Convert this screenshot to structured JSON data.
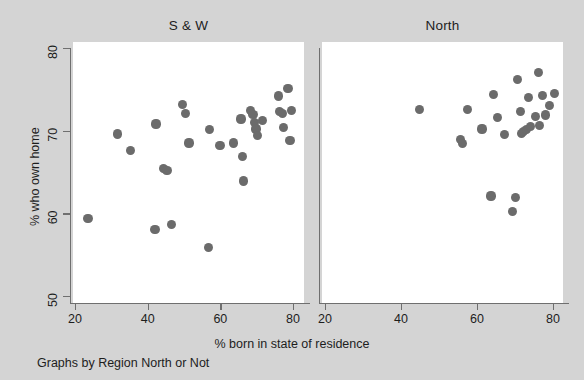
{
  "figure": {
    "background_color": "#d4d4d4",
    "plot_background_color": "#ffffff",
    "marker_color": "#6b6b6b",
    "axis_color": "#6f6f6f",
    "text_color": "#1d1d1d",
    "caption": "Graphs by Region North or Not",
    "xlabel": "% born in state of residence",
    "ylabel": "% who own home"
  },
  "chart_data": {
    "type": "scatter",
    "title": "",
    "subtitle": "",
    "xlabel": "% born in state of residence",
    "ylabel": "% who own home",
    "caption": "Graphs by Region North or Not",
    "grid": false,
    "legend": "none",
    "xlim": [
      16,
      84
    ],
    "ylim": [
      48,
      81
    ],
    "xticks": [
      20,
      40,
      60,
      80
    ],
    "yticks": [
      50,
      60,
      70,
      80
    ],
    "xtick_labels": [
      "20",
      "40",
      "60",
      "80"
    ],
    "ytick_labels": [
      "50",
      "60",
      "70",
      "80"
    ],
    "panels": [
      {
        "label": "S & W",
        "points": [
          {
            "x": 23.6,
            "y": 59.4
          },
          {
            "x": 31.8,
            "y": 69.6
          },
          {
            "x": 35.2,
            "y": 67.6
          },
          {
            "x": 42.0,
            "y": 58.0
          },
          {
            "x": 42.3,
            "y": 70.8
          },
          {
            "x": 44.4,
            "y": 65.4
          },
          {
            "x": 45.3,
            "y": 65.2
          },
          {
            "x": 46.5,
            "y": 58.6
          },
          {
            "x": 49.7,
            "y": 73.2
          },
          {
            "x": 50.4,
            "y": 72.1
          },
          {
            "x": 51.4,
            "y": 68.5
          },
          {
            "x": 56.7,
            "y": 55.9
          },
          {
            "x": 57.0,
            "y": 70.1
          },
          {
            "x": 59.9,
            "y": 68.2
          },
          {
            "x": 63.6,
            "y": 68.5
          },
          {
            "x": 65.7,
            "y": 71.4
          },
          {
            "x": 66.1,
            "y": 66.9
          },
          {
            "x": 66.3,
            "y": 63.9
          },
          {
            "x": 68.3,
            "y": 72.4
          },
          {
            "x": 69.0,
            "y": 72.0
          },
          {
            "x": 69.4,
            "y": 71.0
          },
          {
            "x": 69.8,
            "y": 70.2
          },
          {
            "x": 70.3,
            "y": 69.4
          },
          {
            "x": 71.5,
            "y": 71.2
          },
          {
            "x": 76.0,
            "y": 74.2
          },
          {
            "x": 76.3,
            "y": 72.3
          },
          {
            "x": 77.1,
            "y": 72.1
          },
          {
            "x": 77.4,
            "y": 70.4
          },
          {
            "x": 78.6,
            "y": 75.1
          },
          {
            "x": 79.2,
            "y": 68.8
          },
          {
            "x": 79.6,
            "y": 72.4
          }
        ]
      },
      {
        "label": "North",
        "points": [
          {
            "x": 44.8,
            "y": 72.6
          },
          {
            "x": 55.6,
            "y": 68.9
          },
          {
            "x": 56.2,
            "y": 68.4
          },
          {
            "x": 57.5,
            "y": 72.6
          },
          {
            "x": 61.3,
            "y": 70.2
          },
          {
            "x": 63.7,
            "y": 62.1
          },
          {
            "x": 64.3,
            "y": 74.4
          },
          {
            "x": 65.5,
            "y": 71.6
          },
          {
            "x": 67.2,
            "y": 69.5
          },
          {
            "x": 69.3,
            "y": 60.2
          },
          {
            "x": 70.2,
            "y": 61.9
          },
          {
            "x": 70.6,
            "y": 76.2
          },
          {
            "x": 71.4,
            "y": 72.3
          },
          {
            "x": 71.8,
            "y": 69.7
          },
          {
            "x": 72.2,
            "y": 69.9
          },
          {
            "x": 73.0,
            "y": 70.1
          },
          {
            "x": 73.6,
            "y": 74.0
          },
          {
            "x": 74.1,
            "y": 70.5
          },
          {
            "x": 75.5,
            "y": 71.7
          },
          {
            "x": 76.1,
            "y": 77.0
          },
          {
            "x": 76.4,
            "y": 70.6
          },
          {
            "x": 77.2,
            "y": 74.3
          },
          {
            "x": 78.0,
            "y": 71.9
          },
          {
            "x": 79.1,
            "y": 73.0
          },
          {
            "x": 80.4,
            "y": 74.5
          }
        ]
      }
    ]
  }
}
